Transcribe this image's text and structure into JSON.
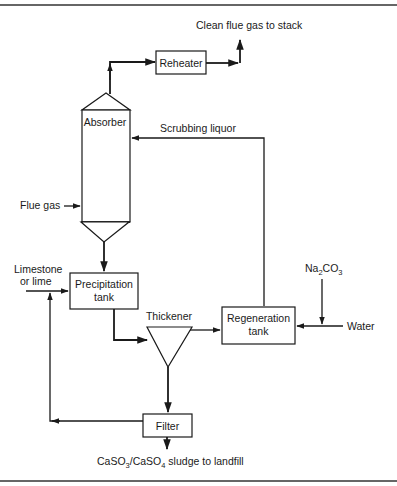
{
  "diagram": {
    "type": "process-flow",
    "units": {
      "reheater": "Reheater",
      "absorber": "Absorber",
      "precipitation_tank": [
        "Precipitation",
        "tank"
      ],
      "thickener": "Thickener",
      "regeneration_tank": [
        "Regeneration",
        "tank"
      ],
      "filter": "Filter"
    },
    "streams": {
      "clean_gas": "Clean flue gas to stack",
      "scrubbing_liquor": "Scrubbing liquor",
      "flue_gas": "Flue gas",
      "limestone": [
        "Limestone",
        "or lime"
      ],
      "na2co3": {
        "main1": "Na",
        "sub1": "2",
        "main2": "CO",
        "sub2": "3"
      },
      "water": "Water",
      "sludge": {
        "p1": "CaSO",
        "s1": "3",
        "p2": "/CaSO",
        "s2": "4",
        "p3": " sludge to landfill"
      }
    },
    "flows": [
      {
        "from": "Absorber",
        "to": "Reheater"
      },
      {
        "from": "Reheater",
        "to": "Clean flue gas to stack"
      },
      {
        "from": "Flue gas",
        "to": "Absorber"
      },
      {
        "from": "Regeneration tank",
        "to": "Absorber",
        "label": "Scrubbing liquor"
      },
      {
        "from": "Absorber",
        "to": "Precipitation tank"
      },
      {
        "from": "Limestone or lime",
        "to": "Precipitation tank"
      },
      {
        "from": "Precipitation tank",
        "to": "Thickener"
      },
      {
        "from": "Thickener",
        "to": "Regeneration tank"
      },
      {
        "from": "Thickener",
        "to": "Filter"
      },
      {
        "from": "Filter",
        "to": "Precipitation tank"
      },
      {
        "from": "Na2CO3",
        "to": "Regeneration tank"
      },
      {
        "from": "Water",
        "to": "Regeneration tank"
      },
      {
        "from": "Filter",
        "to": "CaSO3/CaSO4 sludge to landfill"
      }
    ]
  }
}
